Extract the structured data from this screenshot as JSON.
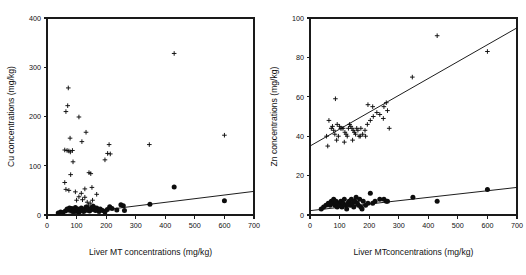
{
  "figure": {
    "background": "#ffffff",
    "marker_color": "#0d0d0d",
    "axis_color": "#1a1a1a"
  },
  "chart_data": [
    {
      "type": "scatter",
      "panel": "left",
      "title": "",
      "xlabel": "Liver MT concentrations (mg/kg)",
      "ylabel": "Cu concentrations (mg/kg)",
      "xlim": [
        0,
        700
      ],
      "ylim": [
        0,
        400
      ],
      "xticks": [
        0,
        100,
        200,
        300,
        400,
        500,
        600,
        700
      ],
      "yticks": [
        0,
        100,
        200,
        300,
        400
      ],
      "grid": false,
      "legend": "none",
      "series": [
        {
          "name": "Cu cross series",
          "marker": "plus",
          "points": [
            [
              72,
              258
            ],
            [
              64,
              210
            ],
            [
              70,
              222
            ],
            [
              108,
              199
            ],
            [
              132,
              168
            ],
            [
              210,
              143
            ],
            [
              430,
              328
            ],
            [
              600,
              162
            ],
            [
              346,
              143
            ],
            [
              78,
              156
            ],
            [
              118,
              149
            ],
            [
              86,
              131
            ],
            [
              60,
              132
            ],
            [
              68,
              131
            ],
            [
              74,
              130
            ],
            [
              79,
              128
            ],
            [
              205,
              125
            ],
            [
              214,
              124
            ],
            [
              196,
              112
            ],
            [
              88,
              108
            ],
            [
              80,
              82
            ],
            [
              142,
              86
            ],
            [
              148,
              84
            ],
            [
              128,
              53
            ],
            [
              152,
              56
            ],
            [
              60,
              66
            ],
            [
              64,
              52
            ],
            [
              74,
              50
            ],
            [
              96,
              47
            ],
            [
              116,
              44
            ],
            [
              168,
              42
            ],
            [
              100,
              30
            ],
            [
              120,
              31
            ],
            [
              136,
              26
            ],
            [
              146,
              24
            ],
            [
              154,
              30
            ],
            [
              140,
              20
            ],
            [
              158,
              18
            ],
            [
              108,
              37
            ],
            [
              128,
              36
            ]
          ]
        },
        {
          "name": "Cu circle series",
          "marker": "filled-circle",
          "points": [
            [
              38,
              4
            ],
            [
              46,
              6
            ],
            [
              54,
              5
            ],
            [
              62,
              8
            ],
            [
              68,
              12
            ],
            [
              72,
              10
            ],
            [
              76,
              14
            ],
            [
              80,
              9
            ],
            [
              84,
              13
            ],
            [
              88,
              7
            ],
            [
              92,
              11
            ],
            [
              96,
              15
            ],
            [
              100,
              8
            ],
            [
              104,
              12
            ],
            [
              108,
              6
            ],
            [
              112,
              10
            ],
            [
              116,
              14
            ],
            [
              120,
              9
            ],
            [
              124,
              7
            ],
            [
              128,
              12
            ],
            [
              132,
              16
            ],
            [
              136,
              10
            ],
            [
              140,
              13
            ],
            [
              144,
              8
            ],
            [
              148,
              11
            ],
            [
              152,
              15
            ],
            [
              156,
              18
            ],
            [
              160,
              12
            ],
            [
              164,
              9
            ],
            [
              168,
              14
            ],
            [
              172,
              10
            ],
            [
              176,
              7
            ],
            [
              180,
              12
            ],
            [
              188,
              9
            ],
            [
              196,
              6
            ],
            [
              204,
              11
            ],
            [
              212,
              17
            ],
            [
              220,
              13
            ],
            [
              236,
              10
            ],
            [
              250,
              21
            ],
            [
              258,
              19
            ],
            [
              262,
              9
            ],
            [
              348,
              22
            ],
            [
              430,
              57
            ],
            [
              600,
              29
            ]
          ]
        }
      ],
      "regression_lines": [
        {
          "name": "Cu trend",
          "x_start": 0,
          "y_start": -4,
          "x_end": 700,
          "y_end": 48
        }
      ]
    },
    {
      "type": "scatter",
      "panel": "right",
      "title": "",
      "xlabel": "Liver MTconcentrations (mg/kg)",
      "ylabel": "Zn concentrations (mg/kg)",
      "xlim": [
        0,
        700
      ],
      "ylim": [
        0,
        100
      ],
      "xticks": [
        0,
        100,
        200,
        300,
        400,
        500,
        600,
        700
      ],
      "yticks": [
        0,
        20,
        40,
        60,
        80,
        100
      ],
      "grid": false,
      "legend": "none",
      "series": [
        {
          "name": "Zn cross series",
          "marker": "plus",
          "points": [
            [
              430,
              91
            ],
            [
              600,
              83
            ],
            [
              346,
              70
            ],
            [
              258,
              57
            ],
            [
              250,
              55
            ],
            [
              212,
              55
            ],
            [
              196,
              56
            ],
            [
              86,
              59
            ],
            [
              64,
              48
            ],
            [
              92,
              46
            ],
            [
              100,
              45
            ],
            [
              104,
              44
            ],
            [
              108,
              44
            ],
            [
              112,
              44
            ],
            [
              118,
              42
            ],
            [
              122,
              41
            ],
            [
              126,
              40
            ],
            [
              130,
              44
            ],
            [
              134,
              46
            ],
            [
              138,
              45
            ],
            [
              142,
              44
            ],
            [
              146,
              43
            ],
            [
              150,
              42
            ],
            [
              154,
              41
            ],
            [
              158,
              44
            ],
            [
              162,
              43
            ],
            [
              166,
              40
            ],
            [
              170,
              40
            ],
            [
              178,
              41
            ],
            [
              186,
              43
            ],
            [
              194,
              46
            ],
            [
              204,
              48
            ],
            [
              214,
              50
            ],
            [
              226,
              52
            ],
            [
              236,
              51
            ],
            [
              248,
              49
            ],
            [
              262,
              53
            ],
            [
              268,
              44
            ],
            [
              56,
              40
            ],
            [
              60,
              35
            ],
            [
              72,
              44
            ],
            [
              76,
              45
            ],
            [
              80,
              43
            ],
            [
              84,
              41
            ],
            [
              90,
              38
            ],
            [
              96,
              40
            ],
            [
              116,
              37
            ],
            [
              144,
              38
            ],
            [
              172,
              44
            ],
            [
              188,
              40
            ]
          ]
        },
        {
          "name": "Zn circle series",
          "marker": "filled-circle",
          "points": [
            [
              38,
              3
            ],
            [
              46,
              4
            ],
            [
              54,
              5
            ],
            [
              62,
              6
            ],
            [
              68,
              5
            ],
            [
              72,
              7
            ],
            [
              76,
              6
            ],
            [
              80,
              8
            ],
            [
              84,
              5
            ],
            [
              88,
              7
            ],
            [
              92,
              4
            ],
            [
              96,
              6
            ],
            [
              100,
              5
            ],
            [
              104,
              7
            ],
            [
              108,
              4
            ],
            [
              112,
              6
            ],
            [
              116,
              8
            ],
            [
              120,
              5
            ],
            [
              124,
              3
            ],
            [
              128,
              6
            ],
            [
              132,
              7
            ],
            [
              136,
              5
            ],
            [
              140,
              8
            ],
            [
              144,
              6
            ],
            [
              148,
              4
            ],
            [
              152,
              7
            ],
            [
              156,
              9
            ],
            [
              160,
              6
            ],
            [
              164,
              5
            ],
            [
              168,
              8
            ],
            [
              172,
              4
            ],
            [
              176,
              3
            ],
            [
              180,
              7
            ],
            [
              188,
              5
            ],
            [
              196,
              6
            ],
            [
              204,
              11
            ],
            [
              212,
              6
            ],
            [
              220,
              7
            ],
            [
              236,
              8
            ],
            [
              250,
              8
            ],
            [
              258,
              7
            ],
            [
              262,
              7
            ],
            [
              348,
              9
            ],
            [
              430,
              7
            ],
            [
              600,
              13
            ]
          ]
        }
      ],
      "regression_lines": [
        {
          "name": "Zn cross trend",
          "x_start": 0,
          "y_start": 35,
          "x_end": 700,
          "y_end": 95
        },
        {
          "name": "Zn circle trend",
          "x_start": 0,
          "y_start": 2.2,
          "x_end": 700,
          "y_end": 14
        }
      ]
    }
  ]
}
